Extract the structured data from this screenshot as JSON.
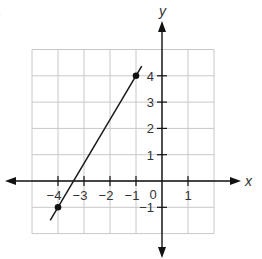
{
  "corner_mark": ")",
  "chart_data": {
    "type": "line",
    "title": "",
    "xlabel": "x",
    "ylabel": "y",
    "xlim": [
      -5,
      2
    ],
    "ylim": [
      -2,
      5
    ],
    "grid": true,
    "x_ticks": [
      -4,
      -3,
      -2,
      -1,
      1
    ],
    "x_tick_labels": [
      "−4",
      "−3",
      "−2",
      "−1",
      "1"
    ],
    "y_ticks": [
      4,
      3,
      2,
      1,
      -1
    ],
    "y_tick_labels": [
      "4",
      "3",
      "2",
      "1",
      "−1"
    ],
    "origin_label": "0",
    "series": [
      {
        "name": "line",
        "points": [
          {
            "x": -4,
            "y": -1
          },
          {
            "x": -1,
            "y": 4
          }
        ],
        "extends_from": {
          "x": -4.3,
          "y": -1.5
        },
        "extends_to": {
          "x": -0.78,
          "y": 4.37
        }
      }
    ],
    "marked_points": [
      {
        "x": -4,
        "y": -1
      },
      {
        "x": -1,
        "y": 4
      }
    ]
  }
}
